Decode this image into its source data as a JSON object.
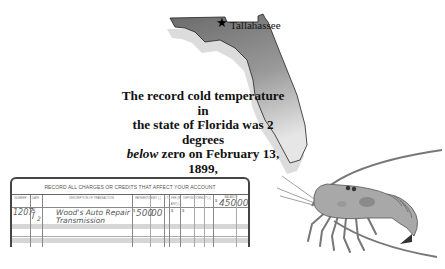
{
  "map": {
    "state": "Florida",
    "capital_label": "Tallahassee",
    "capital_marker_icon": "star-icon",
    "fill_color": "#7a7a7a"
  },
  "fact": {
    "line1": "The record cold temperature in",
    "line2": "the state of Florida was 2 degrees",
    "line3_italic": "below",
    "line3_rest": " zero on February 13, 1899,",
    "line4": "in Tallahassee."
  },
  "register": {
    "title": "RECORD ALL CHARGES OR CREDITS THAT AFFECT YOUR ACCOUNT",
    "columns": [
      {
        "label": "NUMBER"
      },
      {
        "label": "DATE"
      },
      {
        "label": "DESCRIPTION OF TRANSACTION"
      },
      {
        "label": "PAYMENT/DEBIT (-)"
      },
      {
        "label": "√ T"
      },
      {
        "label": "FEE (IF ANY) (-)"
      },
      {
        "label": "DEPOSIT/CREDIT (+)"
      },
      {
        "label": "BALANCE"
      }
    ],
    "balance_start": {
      "dollar": "$",
      "amount": "450",
      "cents": "00"
    },
    "rows": [
      {
        "number": "1207",
        "date_top": "5",
        "date_bottom": "2",
        "description_line1": "Wood's Auto Repair",
        "description_line2": "Transmission",
        "payment_dollar": "$",
        "payment_amount": "500",
        "payment_cents": "00",
        "fee_dollar": "$",
        "deposit_dollar": "$"
      }
    ]
  },
  "illustration": {
    "subject": "spiny lobster"
  }
}
